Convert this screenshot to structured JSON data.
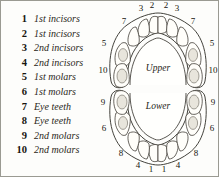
{
  "legend": {
    "items": [
      {
        "number": "1",
        "label": "1st incisors"
      },
      {
        "number": "2",
        "label": "1st incisors"
      },
      {
        "number": "3",
        "label": "2nd incisors"
      },
      {
        "number": "4",
        "label": "2nd incisors"
      },
      {
        "number": "5",
        "label": "1st molars"
      },
      {
        "number": "6",
        "label": "1st molars"
      },
      {
        "number": "7",
        "label": "Eye teeth"
      },
      {
        "number": "8",
        "label": "Eye teeth"
      },
      {
        "number": "9",
        "label": "2nd molars"
      },
      {
        "number": "10",
        "label": "2nd molars"
      }
    ]
  },
  "diagram": {
    "upper_label": "Upper",
    "lower_label": "Lower",
    "upper_positions": {
      "top_left_incisor": "3",
      "top_center_left_incisor": "2",
      "top_center_right_incisor": "2",
      "top_right_incisor": "3",
      "left_eye_tooth": "7",
      "right_eye_tooth": "7",
      "left_first_molar": "5",
      "right_first_molar": "5",
      "left_second_molar": "10",
      "right_second_molar": "10"
    },
    "lower_positions": {
      "left_second_molar": "9",
      "right_second_molar": "9",
      "left_first_molar": "6",
      "right_first_molar": "6",
      "left_eye_tooth": "8",
      "right_eye_tooth": "8",
      "bottom_left_incisor": "4",
      "bottom_center_left_incisor": "1",
      "bottom_center_right_incisor": "1",
      "bottom_right_incisor": "4"
    }
  },
  "colors": {
    "ink": "#2e2c26",
    "page": "#fdfdfb",
    "border": "#9a9a92",
    "tooth_fill": "#fffefa",
    "molar_pit": "#e8e5dc"
  }
}
